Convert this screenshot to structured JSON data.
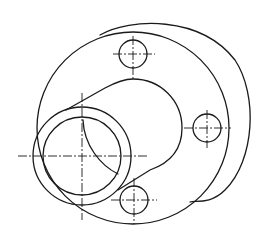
{
  "drawing": {
    "title": "Flange with offset pipe boss",
    "stroke_color": "#1a1a1a",
    "background": "#ffffff",
    "back_flange": {
      "cx": 148,
      "cy": 118,
      "r": 99
    },
    "front_flange": {
      "cx": 133,
      "cy": 128,
      "r": 96
    },
    "boss": {
      "cx": 133,
      "cy": 128,
      "r": 49
    },
    "pipe": {
      "cx": 82,
      "cy": 156,
      "r_outer": 49,
      "r_inner": 39
    },
    "bolt_holes": [
      {
        "name": "top",
        "cx": 133,
        "cy": 54,
        "r": 14
      },
      {
        "name": "right",
        "cx": 207,
        "cy": 128,
        "r": 14
      },
      {
        "name": "bottom",
        "cx": 134,
        "cy": 200,
        "r": 14
      }
    ]
  }
}
